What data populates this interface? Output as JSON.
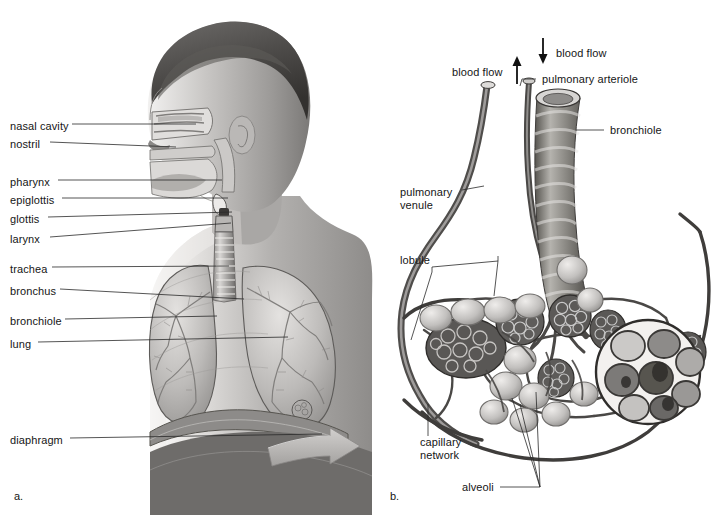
{
  "figure": {
    "style": "grayscale pencil-rendered anatomical illustration",
    "background_color": "#ffffff",
    "line_color": "#1a1a1a",
    "width": 720,
    "height": 515
  },
  "panels": [
    {
      "tag": "a.",
      "tag_x": 14,
      "tag_y": 497,
      "caption": "Sagittal view of head, neck and thorax showing the airway from nose to lungs",
      "labels": [
        {
          "text": "nasal cavity",
          "x": 10,
          "y": 127,
          "leader_to_x": 196,
          "leader_to_y": 127,
          "lines": 1
        },
        {
          "text": "nostril",
          "x": 10,
          "y": 145,
          "leader_to_x": 176,
          "leader_to_y": 150,
          "lines": 1
        },
        {
          "text": "pharynx",
          "x": 10,
          "y": 183,
          "leader_to_x": 222,
          "leader_to_y": 183,
          "lines": 1
        },
        {
          "text": "epiglottis",
          "x": 10,
          "y": 201,
          "leader_to_x": 228,
          "leader_to_y": 201,
          "lines": 1
        },
        {
          "text": "glottis",
          "x": 10,
          "y": 220,
          "leader_to_x": 232,
          "leader_to_y": 213,
          "lines": 1
        },
        {
          "text": "larynx",
          "x": 10,
          "y": 240,
          "leader_to_x": 230,
          "leader_to_y": 224,
          "lines": 1
        },
        {
          "text": "trachea",
          "x": 10,
          "y": 270,
          "leader_to_x": 229,
          "leader_to_y": 268,
          "lines": 1
        },
        {
          "text": "bronchus",
          "x": 10,
          "y": 292,
          "leader_to_x": 243,
          "leader_to_y": 300,
          "lines": 1
        },
        {
          "text": "bronchiole",
          "x": 10,
          "y": 322,
          "leader_to_x": 216,
          "leader_to_y": 318,
          "lines": 1
        },
        {
          "text": "lung",
          "x": 10,
          "y": 345,
          "leader_to_x": 288,
          "leader_to_y": 339,
          "lines": 1
        },
        {
          "text": "diaphragm",
          "x": 10,
          "y": 441,
          "leader_to_x": 320,
          "leader_to_y": 436,
          "lines": 1
        }
      ]
    },
    {
      "tag": "b.",
      "tag_x": 390,
      "tag_y": 497,
      "caption": "Detail of a pulmonary lobule with alveoli and surrounding capillary network",
      "labels": [
        {
          "text": "blood flow",
          "x": 452,
          "y": 72,
          "lines": 1,
          "arrow": "up",
          "arrow_x": 517,
          "arrow_y1": 82,
          "arrow_y2": 58
        },
        {
          "text": "blood flow",
          "x": 556,
          "y": 53,
          "lines": 1,
          "arrow": "down",
          "arrow_x": 543,
          "arrow_y1": 38,
          "arrow_y2": 62
        },
        {
          "text": "pulmonary arteriole",
          "x": 542,
          "y": 82,
          "leader_from_x": 536,
          "leader_from_y": 82,
          "lines": 1
        },
        {
          "text": "bronchiole",
          "x": 610,
          "y": 133,
          "leader_from_x": 604,
          "leader_from_y": 133,
          "lines": 1
        },
        {
          "text": "pulmonary venule",
          "x": 400,
          "y": 194,
          "leader_from_x": 472,
          "leader_from_y": 197,
          "lines": 2,
          "line1": "pulmonary",
          "line2": "venule"
        },
        {
          "text": "lobule",
          "x": 400,
          "y": 261,
          "lines": 1
        },
        {
          "text": "capillary network",
          "x": 420,
          "y": 443,
          "lines": 2,
          "line1": "capillary",
          "line2": "network"
        },
        {
          "text": "alveoli",
          "x": 462,
          "y": 488,
          "lines": 1
        }
      ]
    }
  ],
  "icons": {
    "blood_flow_up": "arrow-up-icon",
    "blood_flow_down": "arrow-down-icon",
    "diaphragm_motion": "block-arrow-right-icon"
  },
  "colors": {
    "background": "#ffffff",
    "text": "#161616",
    "leader_line": "#2a2a2a",
    "tissue_light": "#d8d6d4",
    "tissue_mid": "#a7a5a3",
    "tissue_dark": "#6f6d6c",
    "tissue_darkest": "#3c3b3a",
    "vessel": "#4a4846",
    "arrow_fill": "#b9b7b5"
  }
}
